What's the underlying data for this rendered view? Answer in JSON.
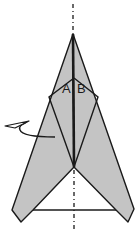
{
  "diagram": {
    "type": "origami-fold-step",
    "labels": {
      "a": "A",
      "b": "B"
    },
    "colors": {
      "paper_fill": "#c4c4c4",
      "stroke": "#1a1a1a",
      "background": "#ffffff"
    },
    "elements": [
      "center-crease-dash-dot",
      "folded-paper-shape",
      "inner-diamond-folds",
      "center-fold-line",
      "base-line",
      "turn-over-arrow"
    ]
  }
}
